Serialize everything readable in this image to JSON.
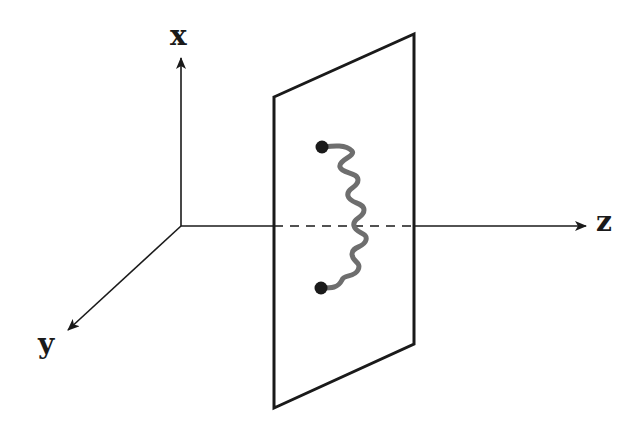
{
  "diagram": {
    "type": "3d-coordinate-system-with-plane",
    "axes": {
      "x": {
        "label": "x",
        "direction": "up"
      },
      "y": {
        "label": "y",
        "direction": "down-left"
      },
      "z": {
        "label": "z",
        "direction": "right"
      }
    },
    "plane": {
      "description": "vertical rectangular plane perpendicular to z-axis, drawn in perspective"
    },
    "spring": {
      "description": "wavy spring connecting two black endpoints lying in the plane",
      "endpoints": 2,
      "color": "#6e6e6e"
    },
    "colors": {
      "line": "#1a1a1a",
      "spring": "#6e6e6e",
      "background": "#ffffff"
    }
  }
}
